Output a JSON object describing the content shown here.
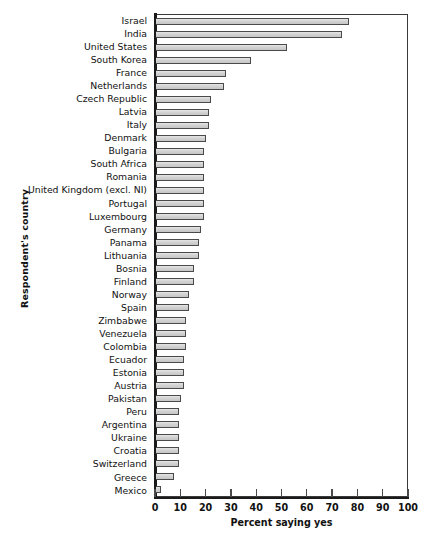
{
  "chart_data": {
    "type": "bar",
    "orientation": "horizontal",
    "title": "",
    "xlabel": "Percent saying yes",
    "ylabel": "Respondent's country",
    "xlim": [
      0,
      100
    ],
    "xticks": [
      0,
      10,
      20,
      30,
      40,
      50,
      60,
      70,
      80,
      90,
      100
    ],
    "grid": false,
    "legend": null,
    "bar_fill_color": "#d6d6d6",
    "bar_edge_color": "#4a4a4a",
    "categories": [
      "Israel",
      "India",
      "United States",
      "South Korea",
      "France",
      "Netherlands",
      "Czech Republic",
      "Latvia",
      "Italy",
      "Denmark",
      "Bulgaria",
      "South Africa",
      "Romania",
      "United Kingdom (excl. NI)",
      "Portugal",
      "Luxembourg",
      "Germany",
      "Panama",
      "Lithuania",
      "Bosnia",
      "Finland",
      "Norway",
      "Spain",
      "Zimbabwe",
      "Venezuela",
      "Colombia",
      "Ecuador",
      "Estonia",
      "Austria",
      "Pakistan",
      "Peru",
      "Argentina",
      "Ukraine",
      "Croatia",
      "Switzerland",
      "Greece",
      "Mexico"
    ],
    "values": [
      77,
      74,
      52,
      38,
      28,
      27,
      22,
      21,
      21,
      20,
      19,
      19,
      19,
      19,
      19,
      19,
      18,
      17,
      17,
      15,
      15,
      13,
      13,
      12,
      12,
      12,
      11,
      11,
      11,
      10,
      9,
      9,
      9,
      9,
      9,
      7,
      2
    ]
  },
  "footnote": ""
}
